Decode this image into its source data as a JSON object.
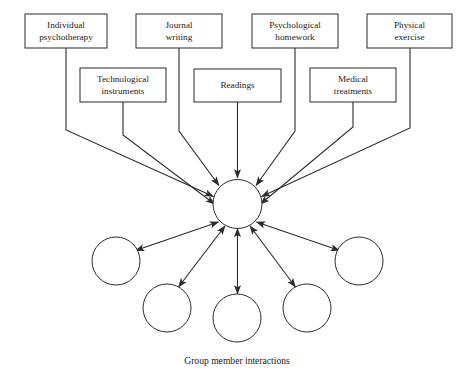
{
  "diagram": {
    "title": "Group member interactions",
    "caption": {
      "text": "Group member interactions",
      "x": 237,
      "y": 364
    },
    "colors": {
      "background": "#ffffff",
      "stroke": "#2b2b2b",
      "text": "#1a1a1a",
      "fill": "#ffffff"
    },
    "canvas": {
      "width": 471,
      "height": 377
    },
    "hub": {
      "name": "central-hub",
      "cx": 237.5,
      "cy": 204,
      "r": 24.5
    },
    "source_boxes": [
      {
        "id": "individual-psychotherapy",
        "line1": "Individual",
        "line2": "psychotherapy",
        "x": 25,
        "y": 14,
        "w": 82,
        "h": 34,
        "row": 1
      },
      {
        "id": "technological-instruments",
        "line1": "Technological",
        "line2": "instruments",
        "x": 80,
        "y": 68,
        "w": 86,
        "h": 34,
        "row": 2
      },
      {
        "id": "journal-writing",
        "line1": "Journal",
        "line2": "writing",
        "x": 136,
        "y": 14,
        "w": 86,
        "h": 34,
        "row": 1
      },
      {
        "id": "readings",
        "line1": "Readings",
        "line2": "",
        "x": 194,
        "y": 69,
        "w": 87,
        "h": 33,
        "row": 2
      },
      {
        "id": "psychological-homework",
        "line1": "Psychological",
        "line2": "homework",
        "x": 252,
        "y": 14,
        "w": 86,
        "h": 34,
        "row": 1
      },
      {
        "id": "medical-treatments",
        "line1": "Medical",
        "line2": "treatments",
        "x": 310,
        "y": 68,
        "w": 86,
        "h": 34,
        "row": 2
      },
      {
        "id": "physical-exercise",
        "line1": "Physical",
        "line2": "exercise",
        "x": 367,
        "y": 14,
        "w": 85,
        "h": 34,
        "row": 1
      }
    ],
    "source_connectors": [
      {
        "id": "connector-individual-psychotherapy",
        "points": "66,48 66,130 213.5,196.5",
        "arrow": "end"
      },
      {
        "id": "connector-technological-instruments",
        "points": "123,102 123,135 214.5,204",
        "arrow": "end"
      },
      {
        "id": "connector-journal-writing",
        "points": "179,48 179,131 219,185.5",
        "arrow": "end"
      },
      {
        "id": "connector-readings",
        "points": "237.5,102 237.5,178",
        "arrow": "end"
      },
      {
        "id": "connector-psychological-homework",
        "points": "295,48 295,131 256,185.5",
        "arrow": "end"
      },
      {
        "id": "connector-medical-treatments",
        "points": "353,102 353,127 260.5,204",
        "arrow": "end"
      },
      {
        "id": "connector-physical-exercise",
        "points": "410,48 410,128 261.5,196.5",
        "arrow": "end"
      }
    ],
    "member_circles": [
      {
        "id": "group-member-1",
        "cx": 116,
        "cy": 261,
        "r": 24
      },
      {
        "id": "group-member-2",
        "cx": 167,
        "cy": 308,
        "r": 24
      },
      {
        "id": "group-member-3",
        "cx": 237,
        "cy": 318,
        "r": 24
      },
      {
        "id": "group-member-4",
        "cx": 307,
        "cy": 308,
        "r": 24
      },
      {
        "id": "group-member-5",
        "cx": 359,
        "cy": 261,
        "r": 24
      }
    ],
    "member_connectors": [
      {
        "id": "connector-member-1",
        "points": "218.5,222 135.5,250.5",
        "arrow": "both"
      },
      {
        "id": "connector-member-2",
        "points": "225,226 178.5,287",
        "arrow": "both"
      },
      {
        "id": "connector-member-3",
        "points": "237.5,228.5 237.5,294",
        "arrow": "both"
      },
      {
        "id": "connector-member-4",
        "points": "250,226 295.5,287",
        "arrow": "both"
      },
      {
        "id": "connector-member-5",
        "points": "256.5,222 339.5,250.5",
        "arrow": "both"
      }
    ]
  }
}
